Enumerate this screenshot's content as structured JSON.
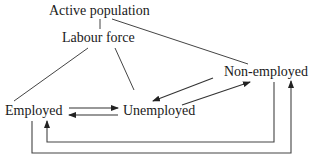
{
  "diagram": {
    "type": "flow-diagram",
    "nodes": {
      "active_population": "Active population",
      "labour_force": "Labour force",
      "non_employed": "Non-employed",
      "employed": "Employed",
      "unemployed": "Unemployed"
    },
    "edges": [
      {
        "from": "Active population",
        "to": "Labour force",
        "style": "line"
      },
      {
        "from": "Active population",
        "to": "Non-employed",
        "style": "line"
      },
      {
        "from": "Labour force",
        "to": "Employed",
        "style": "line"
      },
      {
        "from": "Labour force",
        "to": "Unemployed",
        "style": "line"
      },
      {
        "from": "Employed",
        "to": "Unemployed",
        "style": "arrow"
      },
      {
        "from": "Unemployed",
        "to": "Employed",
        "style": "arrow"
      },
      {
        "from": "Unemployed",
        "to": "Non-employed",
        "style": "arrow"
      },
      {
        "from": "Non-employed",
        "to": "Unemployed",
        "style": "arrow"
      },
      {
        "from": "Non-employed",
        "to": "Employed",
        "style": "arrow"
      },
      {
        "from": "Employed",
        "to": "Non-employed",
        "style": "arrow"
      }
    ],
    "colors": {
      "line": "#444444",
      "text": "#1a1a1a",
      "background": "#ffffff"
    }
  }
}
